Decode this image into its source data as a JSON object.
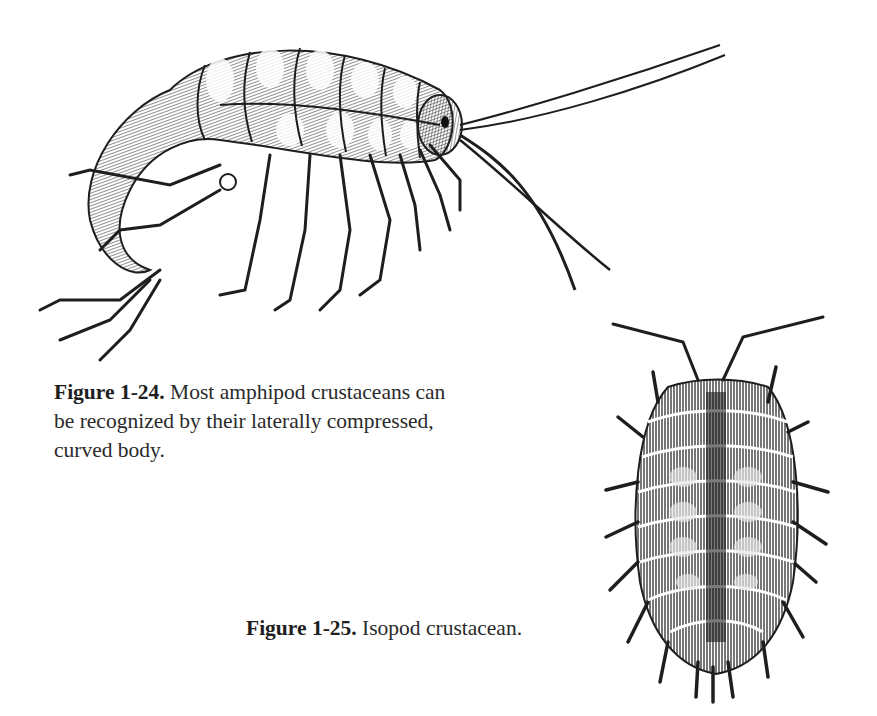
{
  "figures": [
    {
      "id_label": "Figure 1-24.",
      "caption": "Most amphipod crustaceans can be recognized by their laterally compressed, curved body.",
      "caption_lines": [
        "Most amphipod crustaceans can",
        "be recognized by their laterally compressed,",
        "curved body."
      ],
      "illustration": "amphipod-engraving"
    },
    {
      "id_label": "Figure 1-25.",
      "caption": "Isopod crustacean.",
      "illustration": "isopod-engraving"
    }
  ],
  "colors": {
    "background": "#ffffff",
    "ink": "#1e1e1e",
    "text": "#2a2a2a"
  }
}
